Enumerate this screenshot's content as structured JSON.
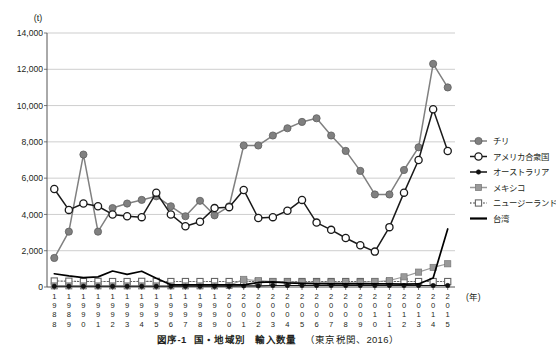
{
  "figure": {
    "unit_label": "(t)",
    "x_axis_unit": "(年)",
    "caption_label": "図序-1",
    "caption_title": "国・地域別　輸入数量",
    "caption_source": "（東京税関、2016）"
  },
  "legend": {
    "position": "right",
    "items": [
      {
        "label": "チリ",
        "marker": "filled-circle",
        "color": "#808080",
        "line": "solid"
      },
      {
        "label": "アメリカ合衆国",
        "marker": "open-circle",
        "color": "#1a1a1a",
        "line": "solid"
      },
      {
        "label": "オーストラリア",
        "marker": "filled-circle-small",
        "color": "#111111",
        "line": "solid"
      },
      {
        "label": "メキシコ",
        "marker": "filled-square",
        "color": "#999999",
        "line": "solid"
      },
      {
        "label": "ニュージーランド",
        "marker": "open-square",
        "color": "#666666",
        "line": "dotted"
      },
      {
        "label": "台湾",
        "marker": "none",
        "color": "#000000",
        "line": "solid"
      }
    ]
  },
  "chart_data": {
    "type": "line",
    "title": "国・地域別　輸入数量",
    "xlabel": "(年)",
    "ylabel": "(t)",
    "ylim": [
      0,
      14000
    ],
    "ytick_step": 2000,
    "ytick_labels": [
      "14,000",
      "12,000",
      "10,000",
      "8,000",
      "6,000",
      "4,000",
      "2,000",
      "0"
    ],
    "grid": true,
    "legend_position": "right",
    "categories": [
      "1988",
      "1989",
      "1990",
      "1991",
      "1992",
      "1993",
      "1994",
      "1995",
      "1996",
      "1997",
      "1998",
      "1999",
      "2000",
      "2001",
      "2002",
      "2003",
      "2004",
      "2005",
      "2006",
      "2007",
      "2008",
      "2009",
      "2010",
      "2011",
      "2012",
      "2013",
      "2014",
      "2015"
    ],
    "series": [
      {
        "name": "チリ",
        "color": "#808080",
        "marker": "filled-circle",
        "values": [
          1600,
          3050,
          7300,
          3050,
          4350,
          4600,
          4800,
          5000,
          4450,
          3900,
          4750,
          3950,
          4450,
          7800,
          7800,
          8350,
          8750,
          9100,
          9300,
          8350,
          7500,
          6400,
          5100,
          5100,
          6450,
          7700,
          12300,
          11000
        ]
      },
      {
        "name": "アメリカ合衆国",
        "color": "#1a1a1a",
        "marker": "open-circle",
        "values": [
          5400,
          4250,
          4600,
          4450,
          4000,
          3900,
          3850,
          5200,
          4000,
          3350,
          3600,
          4350,
          4400,
          5350,
          3800,
          3850,
          4200,
          4800,
          3550,
          3150,
          2700,
          2300,
          1950,
          3300,
          5200,
          7000,
          9800,
          7500
        ]
      },
      {
        "name": "オーストラリア",
        "color": "#111111",
        "marker": "filled-circle-small",
        "values": [
          40,
          40,
          40,
          40,
          40,
          40,
          40,
          40,
          40,
          40,
          40,
          40,
          40,
          60,
          60,
          80,
          80,
          80,
          80,
          80,
          80,
          80,
          80,
          80,
          80,
          80,
          80,
          80
        ]
      },
      {
        "name": "メキシコ",
        "color": "#999999",
        "marker": "filled-square",
        "values": [
          60,
          60,
          60,
          60,
          60,
          60,
          60,
          60,
          60,
          60,
          60,
          60,
          80,
          420,
          350,
          300,
          280,
          260,
          250,
          240,
          230,
          250,
          290,
          360,
          560,
          820,
          1080,
          1280
        ]
      },
      {
        "name": "ニュージーランド",
        "color": "#666666",
        "marker": "open-square",
        "values": [
          330,
          320,
          300,
          310,
          300,
          300,
          310,
          310,
          300,
          300,
          300,
          300,
          300,
          300,
          300,
          300,
          300,
          300,
          300,
          300,
          300,
          300,
          300,
          300,
          300,
          300,
          300,
          300
        ]
      },
      {
        "name": "台湾",
        "color": "#000000",
        "marker": "none",
        "values": [
          730,
          610,
          520,
          560,
          880,
          700,
          870,
          480,
          120,
          120,
          120,
          120,
          120,
          120,
          250,
          280,
          230,
          200,
          180,
          170,
          170,
          170,
          170,
          170,
          160,
          170,
          500,
          3200
        ]
      }
    ]
  }
}
